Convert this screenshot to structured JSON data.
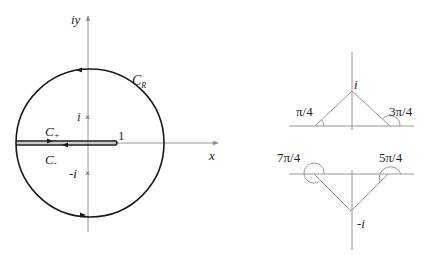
{
  "left_diagram": {
    "axis_y_label": "iy",
    "axis_x_label": "x",
    "contour_big_label": "C",
    "contour_big_sub": "R",
    "contour_plus_label": "C",
    "contour_plus_sub": "+",
    "contour_minus_label": "C",
    "contour_minus_sub": "-",
    "pole_upper_label": "i",
    "pole_lower_label": "-i",
    "pole_marker": "×",
    "branch_end_label": "1"
  },
  "right_top_diagram": {
    "point_label": "i",
    "angle_left": "π/4",
    "angle_right": "3π/4"
  },
  "right_bottom_diagram": {
    "point_label": "-i",
    "angle_left": "7π/4",
    "angle_right": "5π/4"
  },
  "colors": {
    "contour": "#1a1a1a",
    "axis": "#8a8a8a"
  }
}
